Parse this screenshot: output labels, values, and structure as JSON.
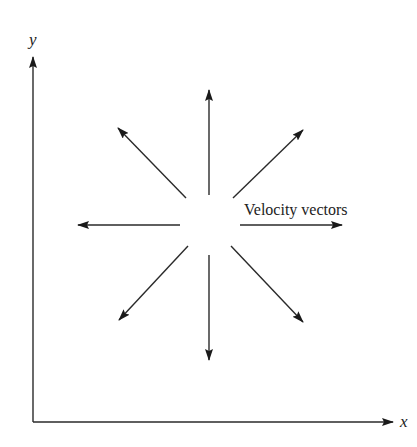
{
  "diagram": {
    "title": "",
    "axes": {
      "x_label": "x",
      "y_label": "y",
      "origin": [
        33,
        422
      ],
      "x_end": [
        395,
        422
      ],
      "y_end": [
        33,
        55
      ]
    },
    "annotation": "Velocity vectors",
    "vectors_center": [
      210,
      225
    ],
    "vectors": [
      {
        "direction": "up",
        "from": [
          209,
          195
        ],
        "to": [
          209,
          90
        ]
      },
      {
        "direction": "down",
        "from": [
          209,
          255
        ],
        "to": [
          209,
          360
        ]
      },
      {
        "direction": "left",
        "from": [
          180,
          225
        ],
        "to": [
          78,
          225
        ]
      },
      {
        "direction": "right",
        "from": [
          240,
          225
        ],
        "to": [
          342,
          225
        ]
      },
      {
        "direction": "up-left",
        "from": [
          186,
          198
        ],
        "to": [
          118,
          128
        ]
      },
      {
        "direction": "up-right",
        "from": [
          233,
          198
        ],
        "to": [
          303,
          130
        ]
      },
      {
        "direction": "down-left",
        "from": [
          188,
          246
        ],
        "to": [
          119,
          320
        ]
      },
      {
        "direction": "down-right",
        "from": [
          231,
          246
        ],
        "to": [
          303,
          322
        ]
      }
    ],
    "colors": {
      "stroke": "#2a2a2a",
      "background": "#ffffff"
    }
  }
}
